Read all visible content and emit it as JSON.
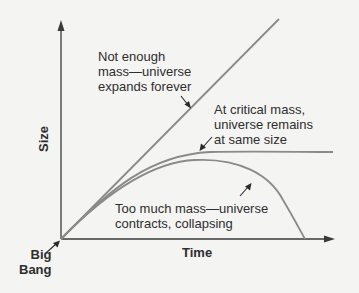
{
  "diagram": {
    "type": "line",
    "axes": {
      "x_label": "Time",
      "y_label": "Size",
      "origin_label_line1": "Big",
      "origin_label_line2": "Bang"
    },
    "curves": [
      {
        "name": "open-universe",
        "description": "straight line rising",
        "annotation": [
          "Not enough",
          "mass—universe",
          "expands forever"
        ]
      },
      {
        "name": "critical-universe",
        "description": "curve flattening to horizontal",
        "annotation": [
          "At critical mass,",
          "universe remains",
          "at same size"
        ]
      },
      {
        "name": "closed-universe",
        "description": "curve rising then falling back to zero",
        "annotation": [
          "Too much mass—universe",
          "contracts, collapsing"
        ]
      }
    ],
    "colors": {
      "axes": "#3a3a3a",
      "curves": "#8a8a8a",
      "arrows": "#2a2a2a",
      "background": "#f4f4f2"
    }
  }
}
